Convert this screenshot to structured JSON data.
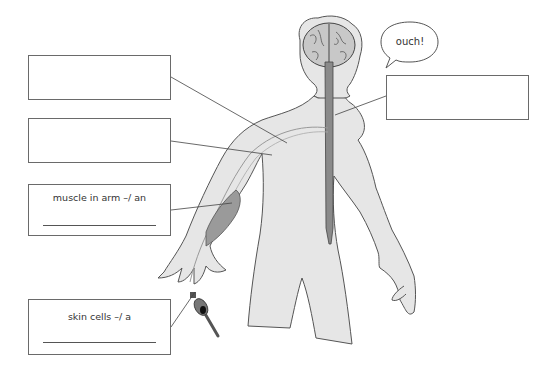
{
  "diagram": {
    "title": "",
    "speech_bubble": {
      "text": "ouch!"
    },
    "label_boxes": [
      {
        "id": "box-1",
        "text": "",
        "has_answer_line": false
      },
      {
        "id": "box-2",
        "text": "",
        "has_answer_line": false
      },
      {
        "id": "box-3",
        "text": "muscle in arm –/ an",
        "has_answer_line": true
      },
      {
        "id": "box-4",
        "text": "skin cells –/ a",
        "has_answer_line": true
      },
      {
        "id": "box-5",
        "text": "",
        "has_answer_line": false
      }
    ],
    "colors": {
      "body_fill": "#e6e6e6",
      "outline": "#555555",
      "spinal_cord": "#8a8a8a",
      "brain": "#c8c8c8",
      "box_border": "#6a6a6a"
    }
  }
}
